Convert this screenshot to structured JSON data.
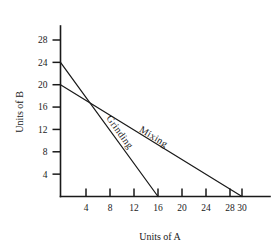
{
  "chart_data": {
    "type": "line",
    "title": "",
    "subtitle": "",
    "xlabel": "Units of A",
    "ylabel": "Units of B",
    "xlim": [
      0,
      33
    ],
    "ylim": [
      0,
      30
    ],
    "grid": false,
    "legend": "inline-annotations",
    "x_ticks": [
      4,
      8,
      12,
      16,
      20,
      24,
      28,
      30
    ],
    "x_tick_labels": [
      "4",
      "8",
      "12",
      "16",
      "20",
      "24",
      "28",
      "30"
    ],
    "y_ticks": [
      4,
      8,
      12,
      16,
      20,
      24,
      28
    ],
    "y_tick_labels": [
      "4",
      "8",
      "12",
      "16",
      "20",
      "24",
      "28"
    ],
    "series": [
      {
        "name": "Grinding",
        "points": [
          [
            0,
            24
          ],
          [
            16,
            0
          ]
        ],
        "x_intercept": 16,
        "y_intercept": 24,
        "label_at": [
          9.2,
          11.2
        ],
        "color": "#1a1a1a"
      },
      {
        "name": "Mixing",
        "points": [
          [
            0,
            20
          ],
          [
            30,
            0
          ]
        ],
        "x_intercept": 30,
        "y_intercept": 20,
        "label_at": [
          15.0,
          10.2
        ],
        "color": "#1a1a1a"
      }
    ],
    "intersection": [
      4.6,
      17.1
    ],
    "annotations": [
      "Grinding",
      "Mixing"
    ]
  },
  "figure": {
    "axis_color": "#1a1a1a",
    "background": "#ffffff"
  }
}
